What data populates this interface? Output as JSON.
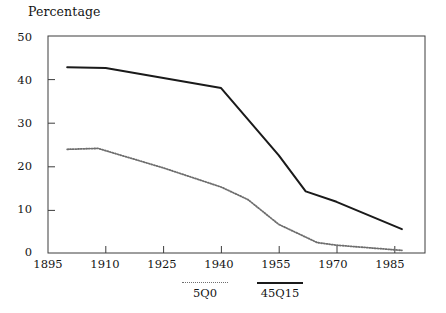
{
  "chart_data": {
    "type": "line",
    "title": "",
    "ylabel": "Percentage",
    "xlabel": "",
    "xlim": [
      1895,
      1993
    ],
    "ylim": [
      0,
      50
    ],
    "grid": false,
    "legend_position": "bottom",
    "x_ticks": [
      "1895",
      "1910",
      "1925",
      "1940",
      "1955",
      "1970",
      "1985"
    ],
    "x_tick_values": [
      1895,
      1910,
      1925,
      1940,
      1955,
      1970,
      1985
    ],
    "y_ticks": [
      "0",
      "10",
      "20",
      "30",
      "40",
      "50"
    ],
    "y_tick_values": [
      0,
      10,
      20,
      30,
      40,
      50
    ],
    "series": [
      {
        "name": "45Q15",
        "style": "solid",
        "color": "#1a1a1a",
        "x": [
          1900,
          1910,
          1940,
          1955,
          1962,
          1970,
          1987
        ],
        "values": [
          42.8,
          42.6,
          38.0,
          22.5,
          14.2,
          11.8,
          5.5
        ]
      },
      {
        "name": "5Q0",
        "style": "dotted",
        "color": "#6e6e6e",
        "x": [
          1900,
          1908,
          1925,
          1940,
          1947,
          1955,
          1965,
          1970,
          1987
        ],
        "values": [
          23.9,
          24.1,
          19.6,
          15.2,
          12.3,
          6.6,
          2.4,
          1.8,
          0.6
        ]
      }
    ]
  },
  "legend": {
    "entries": [
      {
        "label": "5Q0",
        "style": "dotted"
      },
      {
        "label": "45Q15",
        "style": "solid"
      }
    ]
  }
}
